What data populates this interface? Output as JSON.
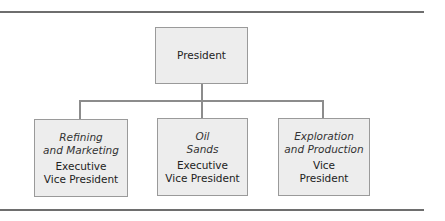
{
  "diagram": {
    "type": "org-chart",
    "root": {
      "title": "President"
    },
    "children": [
      {
        "unit_line1": "Refining",
        "unit_line2": "and Marketing",
        "title_line1": "Executive",
        "title_line2": "Vice President"
      },
      {
        "unit_line1": "Oil",
        "unit_line2": "Sands",
        "title_line1": "Executive",
        "title_line2": "Vice President"
      },
      {
        "unit_line1": "Exploration",
        "unit_line2": "and Production",
        "title_line1": "Vice",
        "title_line2": "President"
      }
    ]
  }
}
